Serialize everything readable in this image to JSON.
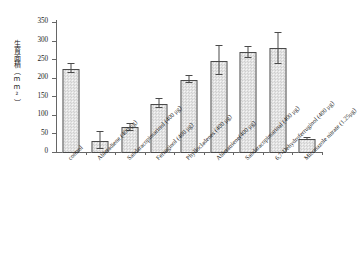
{
  "chart_data": {
    "type": "bar",
    "title": "",
    "xlabel": "",
    "ylabel": "生育面積（mm²）",
    "ylim": [
      0,
      350
    ],
    "yticks": [
      0,
      50,
      100,
      150,
      200,
      250,
      300,
      350
    ],
    "grid": false,
    "legend": "none",
    "categories": [
      "control",
      "Abietadiene (400 μg)",
      "Sandaracopimarinol (400 μg)",
      "Ferruginol (400 μg)",
      "Phyllocladenes (400 μg)",
      "Abietatriene(400 μg)",
      "Sandaracopimarinal (400 μg)",
      "6,7-Dehydroferruginol (400 μg)",
      "Miconazole nitrate (1.25μg)"
    ],
    "values": [
      227,
      33,
      69,
      133,
      197,
      249,
      271,
      282,
      38
    ],
    "errors": [
      12,
      23,
      10,
      12,
      9,
      38,
      14,
      42,
      3
    ],
    "value_unit": "mm²"
  },
  "axis": {
    "y_title": "生育面積（mm²）",
    "tick_labels": [
      "350",
      "300",
      "250",
      "200",
      "150",
      "100",
      "50",
      "0"
    ]
  }
}
